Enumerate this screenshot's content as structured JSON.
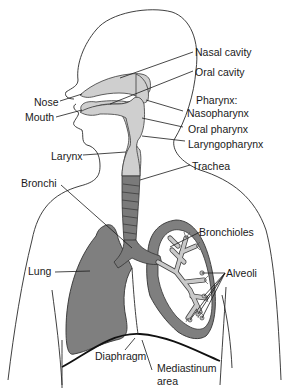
{
  "diagram": {
    "labels": {
      "nasal_cavity": "Nasal cavity",
      "oral_cavity": "Oral cavity",
      "pharynx_heading": "Pharynx:",
      "nasopharynx": "Nasopharynx",
      "oral_pharynx": "Oral pharynx",
      "laryngopharynx": "Laryngopharynx",
      "nose": "Nose",
      "mouth": "Mouth",
      "larynx": "Larynx",
      "trachea": "Trachea",
      "bronchi": "Bronchi",
      "bronchioles": "Bronchioles",
      "lung": "Lung",
      "alveoli": "Alveoli",
      "diaphragm": "Diaphragm",
      "mediastinum_line1": "Mediastinum",
      "mediastinum_line2": "area"
    },
    "colors": {
      "background": "#ffffff",
      "outline": "#2a2a2a",
      "airway_fill": "#cfcfcf",
      "lung_fill": "#7f7f7f",
      "text": "#1a1a1a"
    }
  }
}
